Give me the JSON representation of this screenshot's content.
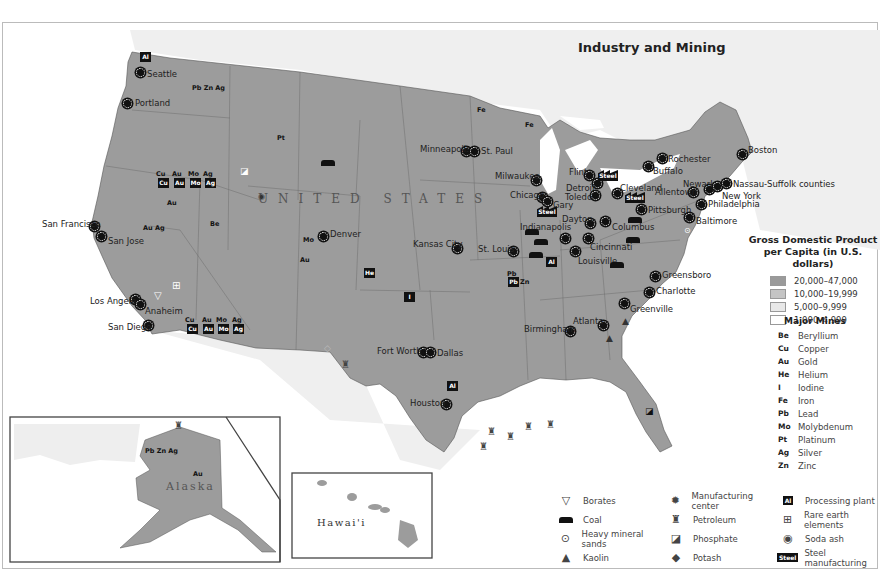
{
  "title": "Industry and Mining",
  "country_label": "UNITED STATES",
  "inset_labels": {
    "alaska": "Alaska",
    "hawaii": "Hawai'i"
  },
  "gdp_legend": {
    "heading_line1": "Gross Domestic Product",
    "heading_line2": "per Capita (in U.S. dollars)",
    "ranges": [
      {
        "label": "20,000–47,000",
        "color": "#9a9a9a"
      },
      {
        "label": "10,000–19,999",
        "color": "#c4c4c4"
      },
      {
        "label": "5,000–9,999",
        "color": "#e4e4e4"
      },
      {
        "label": "1,000–4,999",
        "color": "#ffffff"
      }
    ]
  },
  "mines_legend": {
    "heading": "Major Mines",
    "items": [
      {
        "sym": "Be",
        "label": "Beryllium"
      },
      {
        "sym": "Cu",
        "label": "Copper"
      },
      {
        "sym": "Au",
        "label": "Gold"
      },
      {
        "sym": "He",
        "label": "Helium"
      },
      {
        "sym": "I",
        "label": "Iodine"
      },
      {
        "sym": "Fe",
        "label": "Iron"
      },
      {
        "sym": "Pb",
        "label": "Lead"
      },
      {
        "sym": "Mo",
        "label": "Molybdenum"
      },
      {
        "sym": "Pt",
        "label": "Platinum"
      },
      {
        "sym": "Ag",
        "label": "Silver"
      },
      {
        "sym": "Zn",
        "label": "Zinc"
      }
    ]
  },
  "symbol_legend": [
    {
      "icon": "borates-icon",
      "glyph": "▽",
      "label": "Borates"
    },
    {
      "icon": "manufacturing-center-icon",
      "glyph": "✹",
      "label": "Manufacturing center"
    },
    {
      "icon": "processing-plant-icon",
      "glyph": "Al",
      "label": "Processing plant"
    },
    {
      "icon": "coal-icon",
      "glyph": "coal",
      "label": "Coal"
    },
    {
      "icon": "petroleum-icon",
      "glyph": "♜",
      "label": "Petroleum"
    },
    {
      "icon": "rare-earth-icon",
      "glyph": "⊞",
      "label": "Rare earth elements"
    },
    {
      "icon": "heavy-mineral-sands-icon",
      "glyph": "⊙",
      "label": "Heavy mineral sands"
    },
    {
      "icon": "phosphate-icon",
      "glyph": "◪",
      "label": "Phosphate"
    },
    {
      "icon": "soda-ash-icon",
      "glyph": "◉",
      "label": "Soda ash"
    },
    {
      "icon": "kaolin-icon",
      "glyph": "▲",
      "label": "Kaolin"
    },
    {
      "icon": "potash-icon",
      "glyph": "◆",
      "label": "Potash"
    },
    {
      "icon": "steel-icon",
      "glyph": "Steel",
      "label": "Steel manufacturing"
    }
  ],
  "cities": [
    {
      "name": "Seattle",
      "x": 140,
      "y": 72,
      "lx": 147,
      "ly": 69
    },
    {
      "name": "Portland",
      "x": 127,
      "y": 103,
      "lx": 135,
      "ly": 98
    },
    {
      "name": "San Francisco",
      "x": 94,
      "y": 226,
      "lx": 42,
      "ly": 219
    },
    {
      "name": "San Jose",
      "x": 101,
      "y": 236,
      "lx": 108,
      "ly": 236
    },
    {
      "name": "Los Angeles",
      "x": 135,
      "y": 299,
      "lx": 90,
      "ly": 296
    },
    {
      "name": "Anaheim",
      "x": 140,
      "y": 304,
      "lx": 145,
      "ly": 306
    },
    {
      "name": "San Diego",
      "x": 148,
      "y": 325,
      "lx": 108,
      "ly": 322
    },
    {
      "name": "Denver",
      "x": 323,
      "y": 236,
      "lx": 330,
      "ly": 229
    },
    {
      "name": "Minneapolis",
      "x": 466,
      "y": 151,
      "lx": 420,
      "ly": 144
    },
    {
      "name": "St. Paul",
      "x": 474,
      "y": 151,
      "lx": 481,
      "ly": 146
    },
    {
      "name": "Milwaukee",
      "x": 536,
      "y": 180,
      "lx": 495,
      "ly": 171
    },
    {
      "name": "Chicago",
      "x": 542,
      "y": 197,
      "lx": 510,
      "ly": 190
    },
    {
      "name": "Gary",
      "x": 547,
      "y": 201,
      "lx": 553,
      "ly": 200
    },
    {
      "name": "Kansas City",
      "x": 457,
      "y": 248,
      "lx": 413,
      "ly": 239
    },
    {
      "name": "St. Louis",
      "x": 513,
      "y": 251,
      "lx": 478,
      "ly": 244
    },
    {
      "name": "Indianapolis",
      "x": 565,
      "y": 238,
      "lx": 520,
      "ly": 222
    },
    {
      "name": "Dayton",
      "x": 590,
      "y": 223,
      "lx": 562,
      "ly": 214
    },
    {
      "name": "Columbus",
      "x": 605,
      "y": 221,
      "lx": 612,
      "ly": 222
    },
    {
      "name": "Cincinnati",
      "x": 588,
      "y": 238,
      "lx": 590,
      "ly": 242
    },
    {
      "name": "Louisville",
      "x": 575,
      "y": 251,
      "lx": 578,
      "ly": 256
    },
    {
      "name": "Flint",
      "x": 589,
      "y": 175,
      "lx": 569,
      "ly": 167
    },
    {
      "name": "Detroit",
      "x": 597,
      "y": 183,
      "lx": 566,
      "ly": 183
    },
    {
      "name": "Toledo",
      "x": 595,
      "y": 195,
      "lx": 565,
      "ly": 192
    },
    {
      "name": "Cleveland",
      "x": 617,
      "y": 193,
      "lx": 620,
      "ly": 183
    },
    {
      "name": "Pittsburgh",
      "x": 641,
      "y": 209,
      "lx": 648,
      "ly": 205
    },
    {
      "name": "Rochester",
      "x": 662,
      "y": 158,
      "lx": 668,
      "ly": 154
    },
    {
      "name": "Buffalo",
      "x": 648,
      "y": 166,
      "lx": 653,
      "ly": 166
    },
    {
      "name": "Allentown",
      "x": 693,
      "y": 192,
      "lx": 655,
      "ly": 187
    },
    {
      "name": "Newark",
      "x": 709,
      "y": 189,
      "lx": 683,
      "ly": 179
    },
    {
      "name": "New York",
      "x": 717,
      "y": 186,
      "lx": 722,
      "ly": 191
    },
    {
      "name": "Nassau-Suffolk counties",
      "x": 726,
      "y": 183,
      "lx": 733,
      "ly": 179
    },
    {
      "name": "Philadelphia",
      "x": 701,
      "y": 204,
      "lx": 708,
      "ly": 199
    },
    {
      "name": "Baltimore",
      "x": 689,
      "y": 217,
      "lx": 696,
      "ly": 216
    },
    {
      "name": "Boston",
      "x": 742,
      "y": 154,
      "lx": 748,
      "ly": 145
    },
    {
      "name": "Greensboro",
      "x": 655,
      "y": 276,
      "lx": 662,
      "ly": 270
    },
    {
      "name": "Charlotte",
      "x": 649,
      "y": 292,
      "lx": 656,
      "ly": 286
    },
    {
      "name": "Greenville",
      "x": 624,
      "y": 303,
      "lx": 630,
      "ly": 304
    },
    {
      "name": "Atlanta",
      "x": 603,
      "y": 325,
      "lx": 573,
      "ly": 316
    },
    {
      "name": "Birmingham",
      "x": 570,
      "y": 331,
      "lx": 524,
      "ly": 324
    },
    {
      "name": "Fort Worth",
      "x": 423,
      "y": 352,
      "lx": 377,
      "ly": 346
    },
    {
      "name": "Dallas",
      "x": 430,
      "y": 352,
      "lx": 437,
      "ly": 348
    },
    {
      "name": "Houston",
      "x": 446,
      "y": 404,
      "lx": 410,
      "ly": 398
    }
  ],
  "mines": [
    {
      "text": "Pb Zn Ag",
      "x": 192,
      "y": 84
    },
    {
      "text": "Pt",
      "x": 277,
      "y": 134
    },
    {
      "text": "Cu",
      "x": 156,
      "y": 170
    },
    {
      "text": "Au",
      "x": 172,
      "y": 170
    },
    {
      "text": "Mo",
      "x": 188,
      "y": 170
    },
    {
      "text": "Ag",
      "x": 203,
      "y": 170
    },
    {
      "text": "Au",
      "x": 167,
      "y": 199
    },
    {
      "text": "Au  Ag",
      "x": 143,
      "y": 224
    },
    {
      "text": "Be",
      "x": 210,
      "y": 220
    },
    {
      "text": "Mo",
      "x": 303,
      "y": 236
    },
    {
      "text": "Au",
      "x": 300,
      "y": 256
    },
    {
      "text": "Cu",
      "x": 185,
      "y": 316
    },
    {
      "text": "Au",
      "x": 202,
      "y": 316
    },
    {
      "text": "Mo",
      "x": 216,
      "y": 316
    },
    {
      "text": "Ag",
      "x": 232,
      "y": 316
    },
    {
      "text": "Fe",
      "x": 477,
      "y": 106
    },
    {
      "text": "Fe",
      "x": 525,
      "y": 121
    },
    {
      "text": "Pb",
      "x": 507,
      "y": 270
    },
    {
      "text": "Zn",
      "x": 520,
      "y": 278
    },
    {
      "text": "Pb Zn Ag",
      "x": 145,
      "y": 447
    },
    {
      "text": "Au",
      "x": 193,
      "y": 470
    }
  ]
}
